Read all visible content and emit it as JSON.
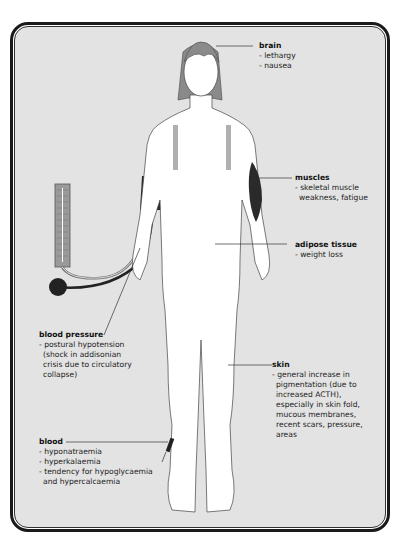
{
  "diagram": {
    "colors": {
      "background": "#e3e3e3",
      "frame": "#1a1a1a",
      "skin": "#ffffff",
      "hair": "#8a8a8a",
      "cuff": "#2a2a2a",
      "muscle": "#2a2a2a"
    },
    "labels": {
      "brain": {
        "title": "brain",
        "items": [
          "- lethargy",
          "- nausea"
        ]
      },
      "muscles": {
        "title": "muscles",
        "items": [
          "- skeletal muscle",
          "weakness, fatigue"
        ]
      },
      "adipose": {
        "title": "adipose tissue",
        "items": [
          "- weight loss"
        ]
      },
      "blood_pressure": {
        "title": "blood pressure",
        "items": [
          "- postural hypotension",
          "(shock in addisonian",
          "crisis due to circulatory",
          "collapse)"
        ]
      },
      "skin": {
        "title": "skin",
        "items": [
          "- general increase in",
          "pigmentation (due to",
          "increased ACTH),",
          "especially in skin fold,",
          "mucous membranes,",
          "recent scars, pressure,",
          "areas"
        ]
      },
      "blood": {
        "title": "blood",
        "items": [
          "- hyponatraemia",
          "- hyperkalaemia",
          "- tendency for hypoglycaemia",
          "and hypercalcaemia"
        ]
      }
    }
  }
}
